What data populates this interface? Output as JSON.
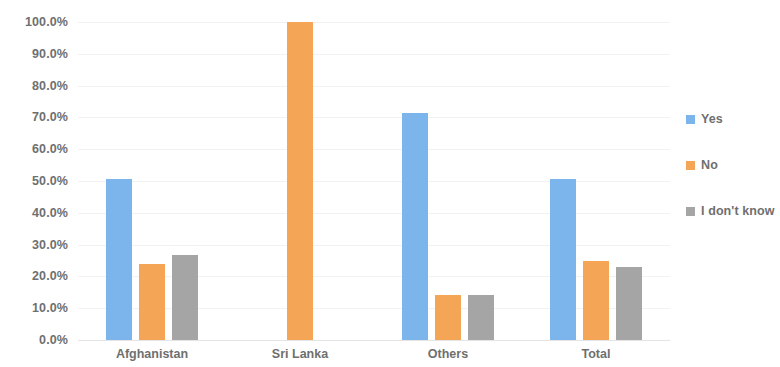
{
  "chart_data": {
    "type": "bar",
    "title": "",
    "subtitle": "",
    "xlabel": "",
    "ylabel": "",
    "categories": [
      "Afghanistan",
      "Sri Lanka",
      "Others",
      "Total"
    ],
    "series": [
      {
        "name": "Yes",
        "color": "#7CB5EC",
        "values": [
          50.5,
          0.0,
          71.5,
          50.7
        ]
      },
      {
        "name": "No",
        "color": "#F5A556",
        "values": [
          23.8,
          100.0,
          14.3,
          25.0
        ]
      },
      {
        "name": "I don't know",
        "color": "#A5A5A5",
        "values": [
          26.7,
          0.0,
          14.3,
          22.9
        ]
      }
    ],
    "ylim": [
      0,
      100
    ],
    "ytick_step": 10,
    "ytick_labels": [
      "100.0%",
      "90.0%",
      "80.0%",
      "70.0%",
      "60.0%",
      "50.0%",
      "40.0%",
      "30.0%",
      "20.0%",
      "10.0%",
      "0.0%"
    ],
    "ytick_values": [
      100,
      90,
      80,
      70,
      60,
      50,
      40,
      30,
      20,
      10,
      0
    ],
    "grid": true,
    "grid_axis": "y",
    "legend_position": "right",
    "legend_entries": [
      "Yes",
      "No",
      "I don't know"
    ],
    "value_labels_shown": false,
    "background": "#FFFFFF",
    "axis_text_color": "#6F6F6F",
    "gridline_color": "#F2F2F2"
  }
}
